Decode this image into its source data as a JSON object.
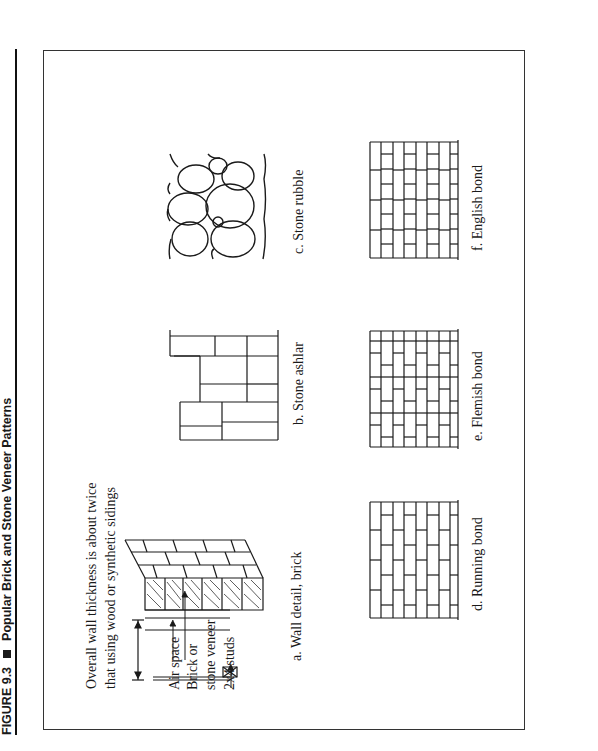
{
  "figure": {
    "number": "FIGURE 9.3",
    "separator_icon": "black-square-icon",
    "title": "Popular Brick and Stone Veneer Patterns"
  },
  "panels": {
    "a": {
      "caption": "a. Wall detail, brick",
      "note_line1": "Overall wall thickness is about twice",
      "note_line2": "that using wood or synthetic sidings",
      "labels": {
        "air_space": "Air space",
        "brick_line1": "Brick or",
        "brick_line2": "stone veneer",
        "studs": "2x4 studs"
      }
    },
    "b": {
      "caption": "b. Stone ashlar"
    },
    "c": {
      "caption": "c. Stone rubble"
    },
    "d": {
      "caption": "d. Running bond"
    },
    "e": {
      "caption": "e. Flemish bond"
    },
    "f": {
      "caption": "f. English bond"
    }
  },
  "colors": {
    "ink": "#1a1a1a",
    "paper": "#ffffff"
  }
}
